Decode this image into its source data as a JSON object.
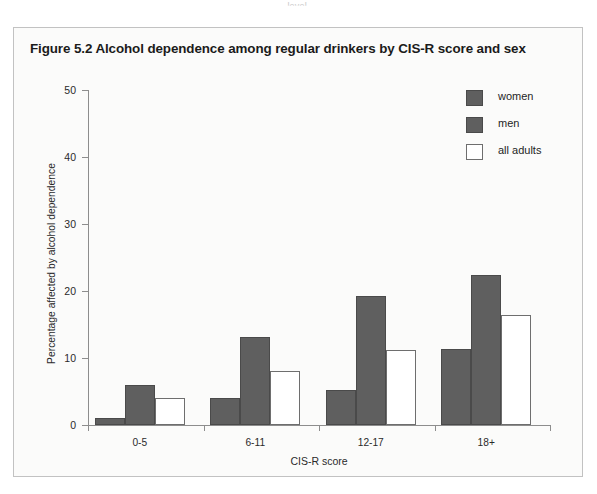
{
  "page": {
    "top_fragment": "level."
  },
  "figure": {
    "title": "Figure 5.2   Alcohol dependence among regular drinkers by CIS-R score and sex"
  },
  "chart_data": {
    "type": "bar",
    "title": "Figure 5.2   Alcohol dependence among regular drinkers by CIS-R score and sex",
    "xlabel": "CIS-R score",
    "ylabel": "Percentage affected by alcohol dependence",
    "categories": [
      "0-5",
      "6-11",
      "12-17",
      "18+"
    ],
    "series": [
      {
        "name": "women",
        "color": "#5f5f5f",
        "values": [
          1.1,
          4.0,
          5.2,
          11.4
        ]
      },
      {
        "name": "men",
        "color": "#5f5f5f",
        "values": [
          6.0,
          13.2,
          19.3,
          22.4
        ]
      },
      {
        "name": "all adults",
        "color": "#ffffff",
        "values": [
          4.0,
          8.1,
          11.2,
          16.4
        ]
      }
    ],
    "ylim": [
      0,
      50
    ],
    "yticks": [
      0,
      10,
      20,
      30,
      40,
      50
    ],
    "ytick_labels": [
      "0",
      "10",
      "20",
      "30",
      "40",
      "50"
    ],
    "grid": false,
    "legend_position": "top-right",
    "legend_entries": [
      "women",
      "men",
      "all adults"
    ]
  }
}
